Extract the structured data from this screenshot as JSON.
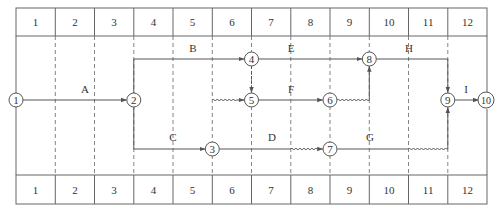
{
  "diagram": {
    "colors": {
      "line": "#555555",
      "grid_dash": "#777777",
      "text": "#333333",
      "background": "#ffffff"
    },
    "top_scale": [
      "1",
      "2",
      "3",
      "4",
      "5",
      "6",
      "7",
      "8",
      "9",
      "10",
      "11",
      "12"
    ],
    "bottom_scale": [
      "1",
      "2",
      "3",
      "4",
      "5",
      "6",
      "7",
      "8",
      "9",
      "10",
      "11",
      "12"
    ],
    "nodes": [
      {
        "id": "1",
        "label": "1"
      },
      {
        "id": "2",
        "label": "2"
      },
      {
        "id": "3",
        "label": "3"
      },
      {
        "id": "4",
        "label": "4"
      },
      {
        "id": "5",
        "label": "5"
      },
      {
        "id": "6",
        "label": "6"
      },
      {
        "id": "7",
        "label": "7"
      },
      {
        "id": "8",
        "label": "8"
      },
      {
        "id": "9",
        "label": "9"
      },
      {
        "id": "10",
        "label": "10"
      }
    ],
    "activities": [
      {
        "name": "A",
        "from": "1",
        "to": "2"
      },
      {
        "name": "B",
        "from": "2",
        "to": "4"
      },
      {
        "name": "C",
        "from": "2",
        "to": "3"
      },
      {
        "name": "D",
        "from": "3",
        "to": "7"
      },
      {
        "name": "E",
        "from": "4",
        "to": "8"
      },
      {
        "name": "F",
        "from": "5",
        "to": "6"
      },
      {
        "name": "G",
        "from": "7",
        "to": "9"
      },
      {
        "name": "H",
        "from": "8",
        "to": "9"
      },
      {
        "name": "I",
        "from": "9",
        "to": "10"
      }
    ],
    "dummies": [
      {
        "from": "4",
        "to": "5"
      },
      {
        "from": "3",
        "to": "5"
      },
      {
        "from": "6",
        "to": "8"
      }
    ]
  }
}
